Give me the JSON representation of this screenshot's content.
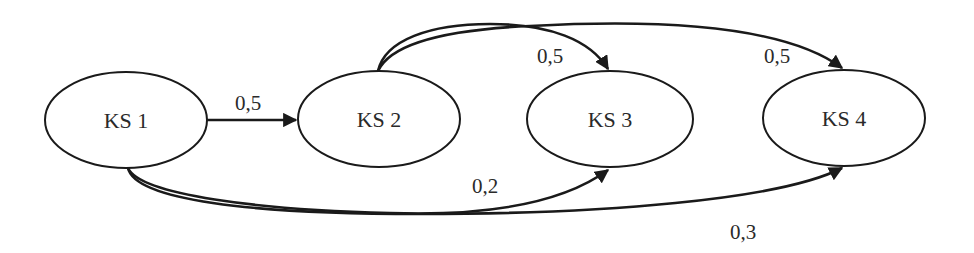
{
  "diagram": {
    "type": "state-transition-graph",
    "colors": {
      "stroke": "#1a1a1a",
      "text": "#2a2a2a",
      "background": "#ffffff"
    },
    "nodes": [
      {
        "id": "ks1",
        "label": "KS 1"
      },
      {
        "id": "ks2",
        "label": "KS 2"
      },
      {
        "id": "ks3",
        "label": "KS 3"
      },
      {
        "id": "ks4",
        "label": "KS 4"
      }
    ],
    "edges": [
      {
        "from": "KS 1",
        "to": "KS 2",
        "label": "0,5"
      },
      {
        "from": "KS 2",
        "to": "KS 3",
        "label": "0,5"
      },
      {
        "from": "KS 2",
        "to": "KS 4",
        "label": "0,5"
      },
      {
        "from": "KS 1",
        "to": "KS 3",
        "label": "0,2"
      },
      {
        "from": "KS 1",
        "to": "KS 4",
        "label": "0,3"
      }
    ]
  }
}
